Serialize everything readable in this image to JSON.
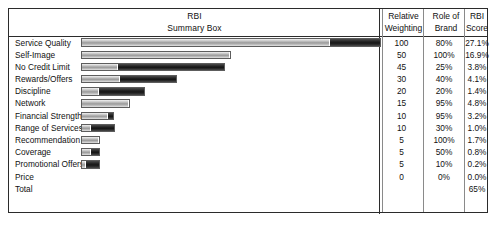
{
  "header": {
    "title_line1": "RBI",
    "title_line2": "Summary Box",
    "columns": [
      {
        "line1": "Relative",
        "line2": "Weighting"
      },
      {
        "line1": "Role of",
        "line2": "Brand"
      },
      {
        "line1": "RBI",
        "line2": "Score"
      }
    ]
  },
  "chart_data": {
    "type": "bar",
    "title": "RBI Summary Box",
    "xlabel": "",
    "ylabel": "",
    "grid": false,
    "legend": "none",
    "orientation": "horizontal",
    "stacked": true,
    "series": [
      {
        "name": "Relative Weighting (light segment)",
        "color": "#b6b6b6"
      },
      {
        "name": "Role of Brand (dark segment)",
        "color": "#202020"
      }
    ],
    "columns": [
      "Relative Weighting",
      "Role of Brand",
      "RBI Score"
    ],
    "categories": [
      "Service Quality",
      "Self-Image",
      "No Credit Limit",
      "Rewards/Offers",
      "Discipline",
      "Network",
      "Financial Strength",
      "Range of Services",
      "Recommendation",
      "Coverage",
      "Promotional Offers",
      "Price",
      "Total"
    ],
    "relative_weighting": [
      100,
      50,
      45,
      30,
      20,
      15,
      10,
      10,
      5,
      5,
      5,
      0,
      null
    ],
    "role_of_brand": [
      "80%",
      "100%",
      "25%",
      "40%",
      "20%",
      "95%",
      "95%",
      "30%",
      "100%",
      "50%",
      "10%",
      "0%",
      null
    ],
    "rbi_score": [
      "27.1%",
      "16.9%",
      "3.8%",
      "4.1%",
      "1.4%",
      "4.8%",
      "3.2%",
      "1.0%",
      "1.7%",
      "0.8%",
      "0.2%",
      "0.0%",
      "65%"
    ],
    "total_rbi_score": "65%"
  },
  "rows": [
    {
      "label": "Service Quality",
      "bar_total": 300,
      "light": 250,
      "dark": 50,
      "rel": "100",
      "role": "80%",
      "rbi": "27.1%"
    },
    {
      "label": "Self-Image",
      "bar_total": 150,
      "light": 150,
      "dark": 0,
      "rel": "50",
      "role": "100%",
      "rbi": "16.9%"
    },
    {
      "label": "No Credit Limit",
      "bar_total": 144,
      "light": 36,
      "dark": 108,
      "rel": "45",
      "role": "25%",
      "rbi": "3.8%"
    },
    {
      "label": "Rewards/Offers",
      "bar_total": 96,
      "light": 39,
      "dark": 57,
      "rel": "30",
      "role": "40%",
      "rbi": "4.1%"
    },
    {
      "label": "Discipline",
      "bar_total": 64,
      "light": 18,
      "dark": 46,
      "rel": "20",
      "role": "20%",
      "rbi": "1.4%"
    },
    {
      "label": "Network",
      "bar_total": 49,
      "light": 49,
      "dark": 0,
      "rel": "15",
      "role": "95%",
      "rbi": "4.8%"
    },
    {
      "label": "Financial Strength",
      "bar_total": 33,
      "light": 28,
      "dark": 5,
      "rel": "10",
      "role": "95%",
      "rbi": "3.2%"
    },
    {
      "label": "Range of Services",
      "bar_total": 34,
      "light": 10,
      "dark": 24,
      "rel": "10",
      "role": "30%",
      "rbi": "1.0%"
    },
    {
      "label": "Recommendation",
      "bar_total": 19,
      "light": 19,
      "dark": 0,
      "rel": "5",
      "role": "100%",
      "rbi": "1.7%"
    },
    {
      "label": "Coverage",
      "bar_total": 19,
      "light": 10,
      "dark": 9,
      "rel": "5",
      "role": "50%",
      "rbi": "0.8%"
    },
    {
      "label": "Promotional Offers",
      "bar_total": 19,
      "light": 4,
      "dark": 15,
      "rel": "5",
      "role": "10%",
      "rbi": "0.2%"
    },
    {
      "label": "Price",
      "bar_total": 0,
      "light": 0,
      "dark": 0,
      "rel": "0",
      "role": "0%",
      "rbi": "0.0%"
    },
    {
      "label": "Total",
      "bar_total": 0,
      "light": 0,
      "dark": 0,
      "rel": "",
      "role": "",
      "rbi": "65%"
    }
  ]
}
